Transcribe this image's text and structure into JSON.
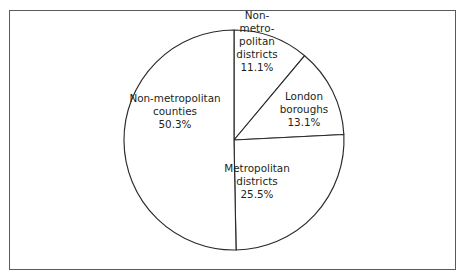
{
  "figure": {
    "background_color": "#ffffff",
    "frame_color": "#555b5e",
    "outline_color": "#2a2a2a",
    "text_color": "#231f20"
  },
  "chart_data": {
    "type": "pie",
    "title": "",
    "subtitle": "",
    "xlabel": "",
    "ylabel": "",
    "legend_position": "none",
    "grid": false,
    "start_angle_deg": 0,
    "direction": "clockwise",
    "center": {
      "x": 234,
      "y": 140
    },
    "radius": 110,
    "categories": [
      "Non-metropolitan districts",
      "London boroughs",
      "Metropolitan districts",
      "Non-metropolitan counties"
    ],
    "values": [
      11.1,
      13.1,
      25.5,
      50.3
    ],
    "value_unit": "%",
    "slices": [
      {
        "name": "non-metropolitan-districts",
        "label_lines": [
          "Non-",
          "metro-",
          "politan",
          "districts"
        ],
        "value": 11.1,
        "value_label": "11.1%",
        "start_deg": 0,
        "end_deg": 39.96,
        "label_x": 257,
        "label_y": 42
      },
      {
        "name": "london-boroughs",
        "label_lines": [
          "London",
          "boroughs"
        ],
        "value": 13.1,
        "value_label": "13.1%",
        "start_deg": 39.96,
        "end_deg": 87.12,
        "label_x": 304,
        "label_y": 110
      },
      {
        "name": "metropolitan-districts",
        "label_lines": [
          "Metropolitan",
          "districts"
        ],
        "value": 25.5,
        "value_label": "25.5%",
        "start_deg": 87.12,
        "end_deg": 178.92,
        "label_x": 257,
        "label_y": 182
      },
      {
        "name": "non-metropolitan-counties",
        "label_lines": [
          "Non-metropolitan",
          "counties"
        ],
        "value": 50.3,
        "value_label": "50.3%",
        "start_deg": 178.92,
        "end_deg": 360,
        "label_x": 175,
        "label_y": 112
      }
    ]
  }
}
